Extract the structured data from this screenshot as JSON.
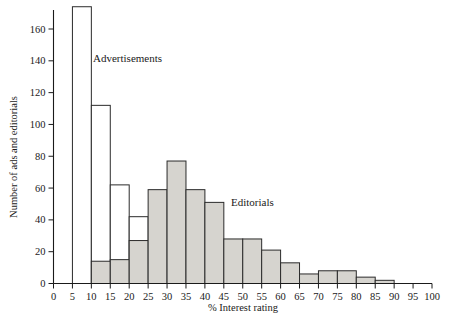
{
  "chart_data": {
    "type": "bar",
    "title": "",
    "subtitle": "",
    "xlabel": "% Interest rating",
    "ylabel": "Number of ads and editorials",
    "xlim": [
      0,
      100
    ],
    "ylim": [
      0,
      180
    ],
    "bin_width": 5,
    "grid": false,
    "legend_position": "inline-annotation",
    "x_ticks": [
      0,
      5,
      10,
      15,
      20,
      25,
      30,
      35,
      40,
      45,
      50,
      55,
      60,
      65,
      70,
      75,
      80,
      85,
      90,
      95,
      100
    ],
    "x_tick_labels": [
      "0",
      "5",
      "10",
      "15",
      "20",
      "25",
      "30",
      "35",
      "40",
      "45",
      "50",
      "55",
      "60",
      "65",
      "70",
      "75",
      "80",
      "85",
      "90",
      "95",
      "100"
    ],
    "y_ticks": [
      0,
      20,
      40,
      60,
      80,
      100,
      120,
      140,
      160
    ],
    "y_tick_labels": [
      "0",
      "20",
      "40",
      "60",
      "80",
      "100",
      "120",
      "140",
      "160"
    ],
    "bin_starts": [
      5,
      10,
      15,
      20,
      25,
      30,
      35,
      40,
      45,
      50,
      55,
      60,
      65,
      70,
      75,
      80,
      85
    ],
    "bin_ends": [
      10,
      15,
      20,
      25,
      30,
      35,
      40,
      45,
      50,
      55,
      60,
      65,
      70,
      75,
      80,
      85,
      90
    ],
    "series": [
      {
        "name": "Advertisements",
        "style": "open-white-bars",
        "values": [
          174,
          112,
          62,
          42,
          13,
          9,
          4,
          3,
          0,
          0,
          0,
          0,
          0,
          0,
          0,
          0,
          0
        ]
      },
      {
        "name": "Editorials",
        "style": "shaded-gray-bars",
        "values": [
          0,
          14,
          15,
          27,
          59,
          77,
          59,
          51,
          28,
          28,
          21,
          13,
          6,
          8,
          8,
          4,
          2
        ]
      }
    ],
    "annotations": [
      {
        "text": "Advertisements",
        "x": 22,
        "y": 140
      },
      {
        "text": "Editorials",
        "x": 57,
        "y": 56
      }
    ]
  },
  "axis": {
    "x_title": "% Interest rating",
    "y_title": "Number of ads and editorials"
  },
  "labels": {
    "advertisements": "Advertisements",
    "editorials": "Editorials"
  },
  "colors": {
    "ads_fill": "#ffffff",
    "editorials_fill": "#d6d4cf",
    "stroke": "#2b2b2b",
    "text": "#1a1a1a",
    "background": "#ffffff"
  }
}
